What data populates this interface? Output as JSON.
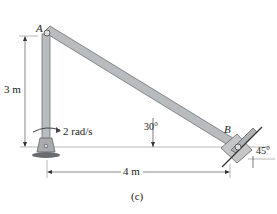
{
  "figure": {
    "caption": "(c)",
    "points": {
      "A": "A",
      "B": "B"
    },
    "dimensions": {
      "height": "3 m",
      "width": "4 m"
    },
    "angles": {
      "rod": "30°",
      "slider_surface": "45°"
    },
    "angular_velocity": "2 rad/s",
    "colors": {
      "rod": "#b9bcbf",
      "rod_edge": "#6e7174",
      "block": "#c4c6c8",
      "line": "#333333"
    }
  }
}
